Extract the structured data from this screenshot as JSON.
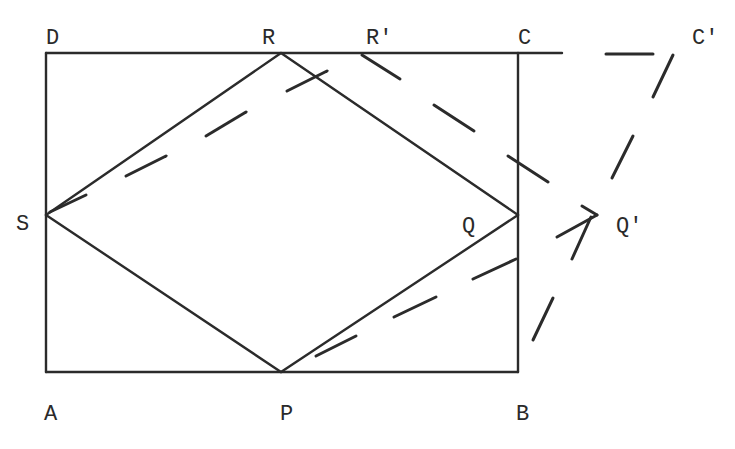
{
  "diagram": {
    "labels": {
      "A": "A",
      "B": "B",
      "C": "C",
      "D": "D",
      "P": "P",
      "Q": "Q",
      "R": "R",
      "S": "S",
      "R_prime": "R'",
      "C_prime": "C'",
      "Q_prime": "Q'"
    },
    "points": {
      "A": [
        46,
        372
      ],
      "B": [
        518,
        372
      ],
      "C": [
        518,
        53
      ],
      "D": [
        46,
        53
      ],
      "P": [
        281,
        372
      ],
      "Q": [
        518,
        215
      ],
      "R": [
        281,
        53
      ],
      "S": [
        46,
        215
      ],
      "R_prime": [
        360,
        53
      ],
      "C_prime": [
        674,
        53
      ],
      "Q_prime": [
        597,
        215
      ]
    },
    "solid_segments": [
      "D-C extended",
      "D-A",
      "A-B",
      "C-B",
      "S-R",
      "R-Q",
      "Q-P",
      "P-S"
    ],
    "dashed_segments": [
      "S-R'",
      "R'-Q'",
      "Q'-P",
      "C-C'",
      "C'-B"
    ],
    "colors": {
      "stroke": "#2b2b2b",
      "background": "#ffffff"
    }
  }
}
